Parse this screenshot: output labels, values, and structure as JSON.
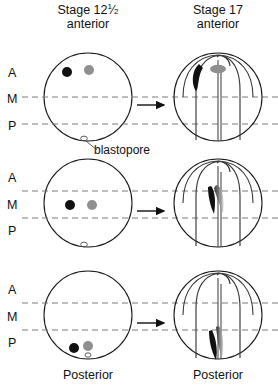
{
  "figure": {
    "type": "embryo-fate-map-diagram",
    "organism_stage_left": "Stage 12",
    "width": 278,
    "height": 392
  },
  "headers": {
    "left": {
      "stage_text": "Stage 12",
      "fraction_num": "1",
      "fraction_den": "2",
      "orientation": "anterior"
    },
    "right": {
      "stage_text": "Stage 17",
      "orientation": "anterior"
    }
  },
  "axis_labels": {
    "anterior": "A",
    "middle": "M",
    "posterior": "P"
  },
  "annotations": {
    "blastopore": "blastopore",
    "posterior_left": "Posterior",
    "posterior_right": "Posterior"
  },
  "colors": {
    "outline": "#1a1a1a",
    "dashed_guide": "#7a7a7a",
    "marker_dark": "#111111",
    "marker_gray": "#8f8f8f",
    "arrow": "#111111",
    "background": "#ffffff"
  },
  "rows": [
    {
      "id": "row-anterior",
      "region": "A",
      "left_panel": {
        "label": "stage-12-half-embryo-anterior",
        "markers": [
          {
            "name": "dark-marker",
            "color": "#111111",
            "region": "A"
          },
          {
            "name": "gray-marker",
            "color": "#8f8f8f",
            "region": "A"
          }
        ],
        "blastopore_marked": true
      },
      "arrow": "→",
      "right_panel": {
        "label": "stage-17-neural-plate-anterior",
        "markers": [
          {
            "name": "dark-marker-crescent",
            "color": "#111111",
            "region": "anterior-neural-fold"
          },
          {
            "name": "gray-marker-oval",
            "color": "#8f8f8f",
            "region": "anterior-neural-plate"
          }
        ]
      }
    },
    {
      "id": "row-middle",
      "region": "M",
      "left_panel": {
        "label": "stage-12-half-embryo-middle",
        "markers": [
          {
            "name": "dark-marker",
            "color": "#111111",
            "region": "M"
          },
          {
            "name": "gray-marker",
            "color": "#8f8f8f",
            "region": "M"
          }
        ],
        "blastopore_marked": true
      },
      "arrow": "→",
      "right_panel": {
        "label": "stage-17-neural-plate-middle",
        "markers": [
          {
            "name": "dark-marker-streak",
            "color": "#111111",
            "region": "mid-neural-groove"
          },
          {
            "name": "gray-marker-streak",
            "color": "#8f8f8f",
            "region": "mid-neural-groove"
          }
        ]
      }
    },
    {
      "id": "row-posterior",
      "region": "P",
      "left_panel": {
        "label": "stage-12-half-embryo-posterior",
        "markers": [
          {
            "name": "dark-marker",
            "color": "#111111",
            "region": "P"
          },
          {
            "name": "gray-marker",
            "color": "#8f8f8f",
            "region": "P"
          }
        ],
        "blastopore_marked": true
      },
      "arrow": "→",
      "right_panel": {
        "label": "stage-17-neural-plate-posterior",
        "markers": [
          {
            "name": "dark-marker-streak",
            "color": "#111111",
            "region": "posterior-neural-groove"
          },
          {
            "name": "gray-marker-streak",
            "color": "#8f8f8f",
            "region": "posterior-neural-groove"
          }
        ]
      }
    }
  ]
}
